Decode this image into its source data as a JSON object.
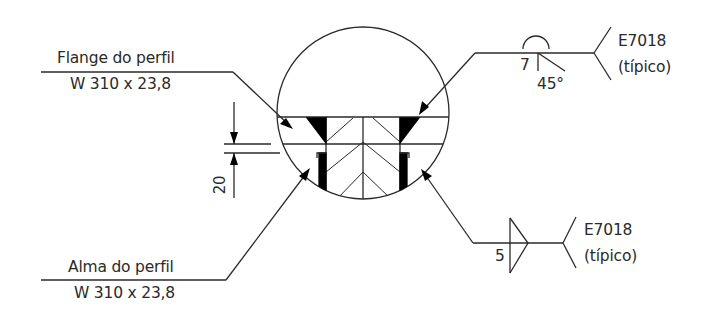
{
  "diagram": {
    "type": "welding-detail",
    "stroke_color": "#2a2a2a",
    "fill_color": "#000000",
    "callouts": {
      "flange": {
        "label": "Flange do perfil",
        "profile": "W 310 x 23,8"
      },
      "web": {
        "label": "Alma do perfil",
        "profile": "W 310 x 23,8"
      }
    },
    "dimension": {
      "value": "20"
    },
    "weld_symbols": {
      "top": {
        "size": "7",
        "angle": "45°",
        "electrode": "E7018",
        "note": "(típico)"
      },
      "bottom": {
        "size": "5",
        "electrode": "E7018",
        "note": "(típico)"
      }
    }
  }
}
